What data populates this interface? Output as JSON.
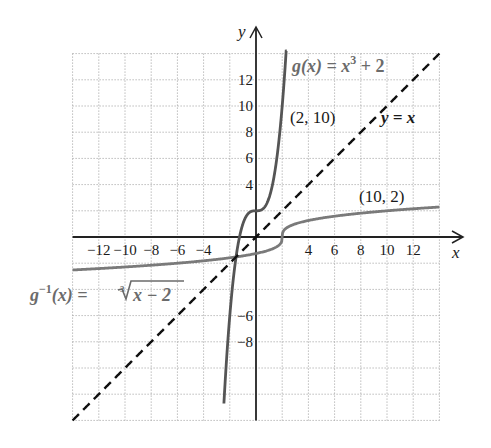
{
  "chart_data": {
    "type": "line",
    "title": "",
    "xlabel": "x",
    "ylabel": "y",
    "xlim": [
      -14,
      14
    ],
    "ylim": [
      -14,
      14
    ],
    "grid": true,
    "grid_spacing": 2,
    "x_tick_labels": [
      "-12",
      "-10",
      "-8",
      "-6",
      "-4",
      "4",
      "6",
      "8",
      "10",
      "12"
    ],
    "y_tick_labels": [
      "12",
      "10",
      "8",
      "6",
      "4",
      "-6",
      "-8"
    ],
    "series": [
      {
        "name": "g(x) = x^3 + 2",
        "style": "solid",
        "color": "#555555",
        "formula": "x^3 + 2",
        "domain": [
          -2.45,
          2.35
        ],
        "sample_points": [
          [
            -2.4,
            -11.82
          ],
          [
            -2,
            -6
          ],
          [
            -1,
            1
          ],
          [
            0,
            2
          ],
          [
            1,
            3
          ],
          [
            2,
            10
          ],
          [
            2.3,
            14.17
          ]
        ]
      },
      {
        "name": "g^-1(x) = cbrt(x - 2)",
        "style": "solid",
        "color": "#7a7a7a",
        "formula": "cbrt(x - 2)",
        "domain": [
          -14,
          14
        ],
        "sample_points": [
          [
            -14,
            -2.52
          ],
          [
            -6,
            -2
          ],
          [
            1,
            -1
          ],
          [
            2,
            0
          ],
          [
            3,
            1
          ],
          [
            10,
            2
          ],
          [
            14,
            2.29
          ]
        ]
      },
      {
        "name": "y = x",
        "style": "dashed",
        "color": "#111111",
        "formula": "x",
        "domain": [
          -14,
          14
        ],
        "sample_points": [
          [
            -14,
            -14
          ],
          [
            0,
            0
          ],
          [
            14,
            14
          ]
        ]
      }
    ],
    "annotations": [
      {
        "text": "g(x) = x³ + 2",
        "near": [
          5.5,
          13
        ]
      },
      {
        "text": "(2, 10)",
        "near": [
          4.5,
          9.5
        ]
      },
      {
        "text": "y = x",
        "near": [
          11,
          8.5
        ]
      },
      {
        "text": "(10, 2)",
        "near": [
          12,
          3.2
        ]
      },
      {
        "text": "g⁻¹(x) = ∛(x − 2)",
        "near": [
          -10,
          -4.5
        ]
      }
    ]
  },
  "labels": {
    "x_axis": "x",
    "y_axis": "y",
    "g_name": "g",
    "g_rest": "(x) = x",
    "g_exp": "3",
    "g_tail": " + 2",
    "point_2_10": "(2, 10)",
    "y_eq_x": "y = x",
    "point_10_2": "(10, 2)",
    "ginv_g": "g",
    "ginv_exp": "−1",
    "ginv_rest": "(x) = ",
    "ginv_index": "3",
    "ginv_radicand": "x − 2"
  }
}
